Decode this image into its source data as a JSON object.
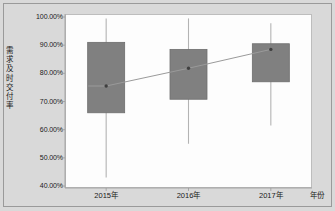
{
  "chart_data": {
    "type": "box",
    "title": "",
    "xlabel": "年份",
    "ylabel": "需求及时交付率",
    "categories": [
      "2015年",
      "2016年",
      "2017年"
    ],
    "ylim": [
      0.4,
      1.0
    ],
    "ytick_step": 0.1,
    "ytick_labels": [
      "100.00%",
      "90.00%",
      "80.00%",
      "70.00%",
      "60.00%",
      "50.00%",
      "40.00%"
    ],
    "ytick_values": [
      1.0,
      0.9,
      0.8,
      0.7,
      0.6,
      0.5,
      0.4
    ],
    "grid": false,
    "legend": "none",
    "series_name": "需求及时交付率",
    "boxes": [
      {
        "category": "2015年",
        "whisker_low": 0.43,
        "q1": 0.66,
        "mean": 0.755,
        "q3": 0.91,
        "whisker_high": 0.995
      },
      {
        "category": "2016年",
        "whisker_low": 0.55,
        "q1": 0.708,
        "mean": 0.818,
        "q3": 0.885,
        "whisker_high": 0.995
      },
      {
        "category": "2017年",
        "whisker_low": 0.615,
        "q1": 0.77,
        "mean": 0.885,
        "q3": 0.905,
        "whisker_high": 0.978
      }
    ],
    "mean_line": {
      "label": "均值连线",
      "values": [
        0.755,
        0.818,
        0.885
      ]
    },
    "colors": {
      "box_fill": "#808080",
      "box_edge": "#6e6e6e",
      "whisker": "#b3b3b3",
      "mean_marker": "#3f3f3f",
      "mean_line": "#9a9a9a",
      "plot_background": "#fdfdfd",
      "figure_background": "#d9d9d9",
      "axis": "#9a9a9a",
      "text": "#1a1a1a"
    }
  }
}
